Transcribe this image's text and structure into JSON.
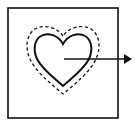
{
  "diagram": {
    "colors": {
      "background": "#ffffff",
      "stroke": "#111111"
    },
    "elements": {
      "frame": "square-border",
      "inner_shape": "heart-solid-outline",
      "outer_shape": "heart-dashed-outline",
      "pointer": "arrow-right"
    }
  }
}
